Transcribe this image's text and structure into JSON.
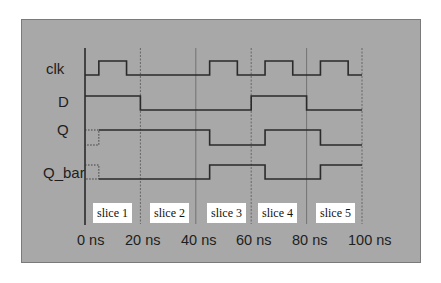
{
  "diagram": {
    "type": "timing-diagram",
    "signals": [
      {
        "name": "clk",
        "label": "clk",
        "transitions_ns": [
          [
            0,
            0
          ],
          [
            5,
            1
          ],
          [
            15,
            0
          ],
          [
            45,
            1
          ],
          [
            55,
            0
          ],
          [
            65,
            1
          ],
          [
            75,
            0
          ],
          [
            85,
            1
          ],
          [
            95,
            0
          ],
          [
            100,
            0
          ]
        ]
      },
      {
        "name": "D",
        "label": "D",
        "transitions_ns": [
          [
            0,
            1
          ],
          [
            20,
            0
          ],
          [
            60,
            1
          ],
          [
            80,
            0
          ],
          [
            100,
            0
          ]
        ]
      },
      {
        "name": "Q",
        "label": "Q",
        "unknown_until_ns": 5,
        "transitions_ns": [
          [
            5,
            1
          ],
          [
            45,
            0
          ],
          [
            65,
            1
          ],
          [
            85,
            0
          ],
          [
            100,
            0
          ]
        ]
      },
      {
        "name": "Q_bar",
        "label": "Q_bar",
        "unknown_until_ns": 5,
        "transitions_ns": [
          [
            5,
            0
          ],
          [
            45,
            1
          ],
          [
            65,
            0
          ],
          [
            85,
            1
          ],
          [
            100,
            1
          ]
        ]
      }
    ],
    "time_axis": {
      "ticks": [
        "0 ns",
        "20 ns",
        "40 ns",
        "60 ns",
        "80 ns",
        "100 ns"
      ],
      "tick_values_ns": [
        0,
        20,
        40,
        60,
        80,
        100
      ]
    },
    "slices": [
      "slice 1",
      "slice 2",
      "slice 3",
      "slice 4",
      "slice 5"
    ],
    "colors": {
      "background": "#a8a8a8",
      "trace": "#2a2a2a",
      "slice_box": "#ffffff"
    }
  }
}
